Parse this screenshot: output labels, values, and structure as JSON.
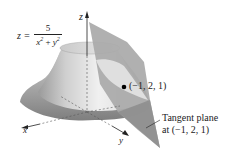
{
  "figure": {
    "equation": {
      "lhs": "z =",
      "numerator": "5",
      "denominator_x": "x",
      "denominator_plus": " + ",
      "denominator_y": "y",
      "exponent": "2"
    },
    "axes": {
      "x_label": "x",
      "y_label": "y",
      "z_label": "z"
    },
    "point_label": "(−1, 2, 1)",
    "tangent_plane_label_line1": "Tangent plane",
    "tangent_plane_label_line2": "at (−1, 2, 1)",
    "colors": {
      "surface_light": "#e8e8e8",
      "surface_dark": "#8a8a8a",
      "plane": "#a9a9a9",
      "plane_dark": "#8f8f8f",
      "point": "#000000",
      "axis": "#222222"
    }
  }
}
